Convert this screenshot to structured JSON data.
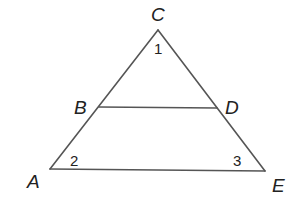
{
  "diagram": {
    "points": [
      {
        "id": "C",
        "label": "C"
      },
      {
        "id": "B",
        "label": "B"
      },
      {
        "id": "D",
        "label": "D"
      },
      {
        "id": "A",
        "label": "A"
      },
      {
        "id": "E",
        "label": "E"
      }
    ],
    "segments": [
      "CA",
      "CE",
      "AE",
      "BD"
    ],
    "angles": [
      {
        "label": "1",
        "vertex": "C"
      },
      {
        "label": "2",
        "vertex": "A"
      },
      {
        "label": "3",
        "vertex": "E"
      }
    ]
  }
}
